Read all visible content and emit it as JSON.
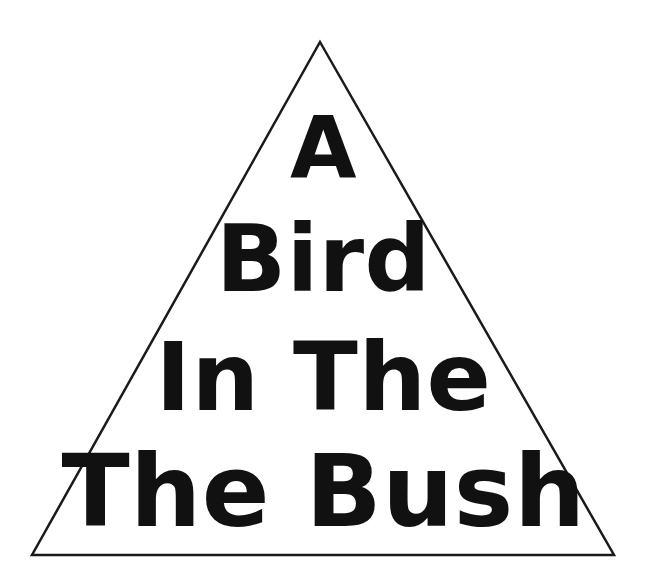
{
  "figure": {
    "name": "pyramid-proverb-diagram",
    "width": 647,
    "height": 581,
    "background_color": "#ffffff",
    "ink_color": "#111111"
  },
  "triangle": {
    "shape": "triangle",
    "fill": "#ffffff",
    "stroke": "#1a1a1a",
    "stroke_width": 2.5,
    "apex": {
      "x": 320,
      "y": 42
    },
    "bottom_left": {
      "x": 32,
      "y": 555
    },
    "bottom_right": {
      "x": 614,
      "y": 555
    }
  },
  "text_lines": [
    {
      "id": "line-1",
      "text": "A"
    },
    {
      "id": "line-2",
      "text": "Bird"
    },
    {
      "id": "line-3",
      "text": "In The"
    },
    {
      "id": "line-4",
      "text": "The Bush"
    }
  ],
  "full_phrase": "A Bird In The The Bush"
}
